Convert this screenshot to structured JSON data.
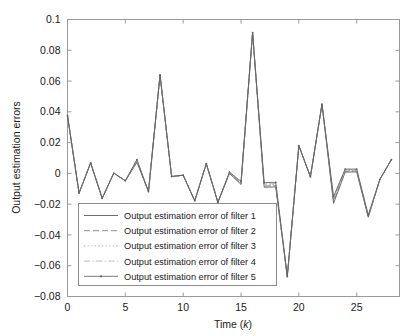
{
  "chart_data": {
    "type": "line",
    "title": "",
    "xlabel": "Time (k)",
    "xlabel_plain": "Time (",
    "xlabel_italic": "k",
    "xlabel_close": ")",
    "ylabel": "Output estimation errors",
    "xlim": [
      0,
      28.7
    ],
    "ylim": [
      -0.08,
      0.1
    ],
    "xticks": [
      0,
      5,
      10,
      15,
      20,
      25
    ],
    "xtick_labels": [
      "0",
      "5",
      "10",
      "15",
      "20",
      "25"
    ],
    "yticks": [
      -0.08,
      -0.06,
      -0.04,
      -0.02,
      0,
      0.02,
      0.04,
      0.06,
      0.08,
      0.1
    ],
    "ytick_labels": [
      "-0.08",
      "-0.06",
      "-0.04",
      "-0.02",
      "0",
      "0.02",
      "0.04",
      "0.06",
      "0.08",
      "0.1"
    ],
    "grid": false,
    "legend_position": "lower-left-inside",
    "x": [
      0,
      1,
      2,
      3,
      4,
      5,
      6,
      7,
      8,
      9,
      10,
      11,
      12,
      13,
      14,
      15,
      16,
      17,
      18,
      19,
      20,
      21,
      22,
      23,
      24,
      25,
      26,
      27,
      28
    ],
    "series": [
      {
        "name": "Output estimation error of filter 1",
        "style": "solid",
        "color": "#555555",
        "values": [
          0.0375,
          -0.0128,
          0.0068,
          -0.0162,
          0.0002,
          -0.0048,
          0.0072,
          -0.0118,
          0.064,
          -0.002,
          -0.0012,
          -0.0178,
          0.0063,
          -0.0188,
          0.0,
          -0.0072,
          0.0915,
          -0.009,
          -0.0088,
          -0.067,
          0.018,
          -0.0022,
          0.045,
          -0.0195,
          0.0008,
          0.001,
          -0.0285,
          -0.004,
          0.009
        ]
      },
      {
        "name": "Output estimation error of filter 2",
        "style": "dashed",
        "color": "#6a6a6a",
        "values": [
          0.0375,
          -0.0128,
          0.0068,
          -0.0162,
          0.0002,
          -0.0048,
          0.0078,
          -0.0118,
          0.064,
          -0.002,
          -0.0012,
          -0.0178,
          0.0063,
          -0.0188,
          0.0002,
          -0.0068,
          0.0915,
          -0.0082,
          -0.008,
          -0.067,
          0.018,
          -0.0022,
          0.045,
          -0.018,
          0.0013,
          0.0015,
          -0.0282,
          -0.004,
          0.009
        ]
      },
      {
        "name": "Output estimation error of filter 3",
        "style": "dotted",
        "color": "#8e8e8e",
        "values": [
          0.0375,
          -0.0128,
          0.0068,
          -0.0162,
          0.0002,
          -0.0048,
          0.0082,
          -0.0118,
          0.064,
          -0.002,
          -0.0012,
          -0.0178,
          0.0063,
          -0.0188,
          0.0004,
          -0.0063,
          0.0915,
          -0.0075,
          -0.0073,
          -0.067,
          0.018,
          -0.0022,
          0.045,
          -0.017,
          0.0018,
          0.002,
          -0.0278,
          -0.004,
          0.009
        ]
      },
      {
        "name": "Output estimation error of filter 4",
        "style": "dashdot",
        "color": "#9c9c9c",
        "values": [
          0.0375,
          -0.0128,
          0.0068,
          -0.0162,
          0.0002,
          -0.0048,
          0.0086,
          -0.0118,
          0.064,
          -0.002,
          -0.0012,
          -0.0178,
          0.0063,
          -0.0188,
          0.0006,
          -0.0058,
          0.0915,
          -0.0068,
          -0.0066,
          -0.067,
          0.018,
          -0.0022,
          0.045,
          -0.016,
          0.0023,
          0.0024,
          -0.0274,
          -0.004,
          0.009
        ]
      },
      {
        "name": "Output estimation error of filter 5",
        "style": "solid-dot",
        "color": "#5f5f5f",
        "values": [
          0.0375,
          -0.0128,
          0.0068,
          -0.0162,
          0.0002,
          -0.0048,
          0.009,
          -0.0118,
          0.064,
          -0.002,
          -0.0012,
          -0.0178,
          0.0063,
          -0.0188,
          0.0008,
          -0.0052,
          0.0915,
          -0.006,
          -0.0058,
          -0.067,
          0.018,
          -0.0022,
          0.045,
          -0.015,
          0.0028,
          0.0028,
          -0.027,
          -0.004,
          0.009
        ]
      }
    ]
  },
  "legend": {
    "entries": [
      {
        "label": "Output estimation error of filter 1"
      },
      {
        "label": "Output estimation error of filter 2"
      },
      {
        "label": "Output estimation error of filter 3"
      },
      {
        "label": "Output estimation error of filter 4"
      },
      {
        "label": "Output estimation error of filter 5"
      }
    ]
  }
}
